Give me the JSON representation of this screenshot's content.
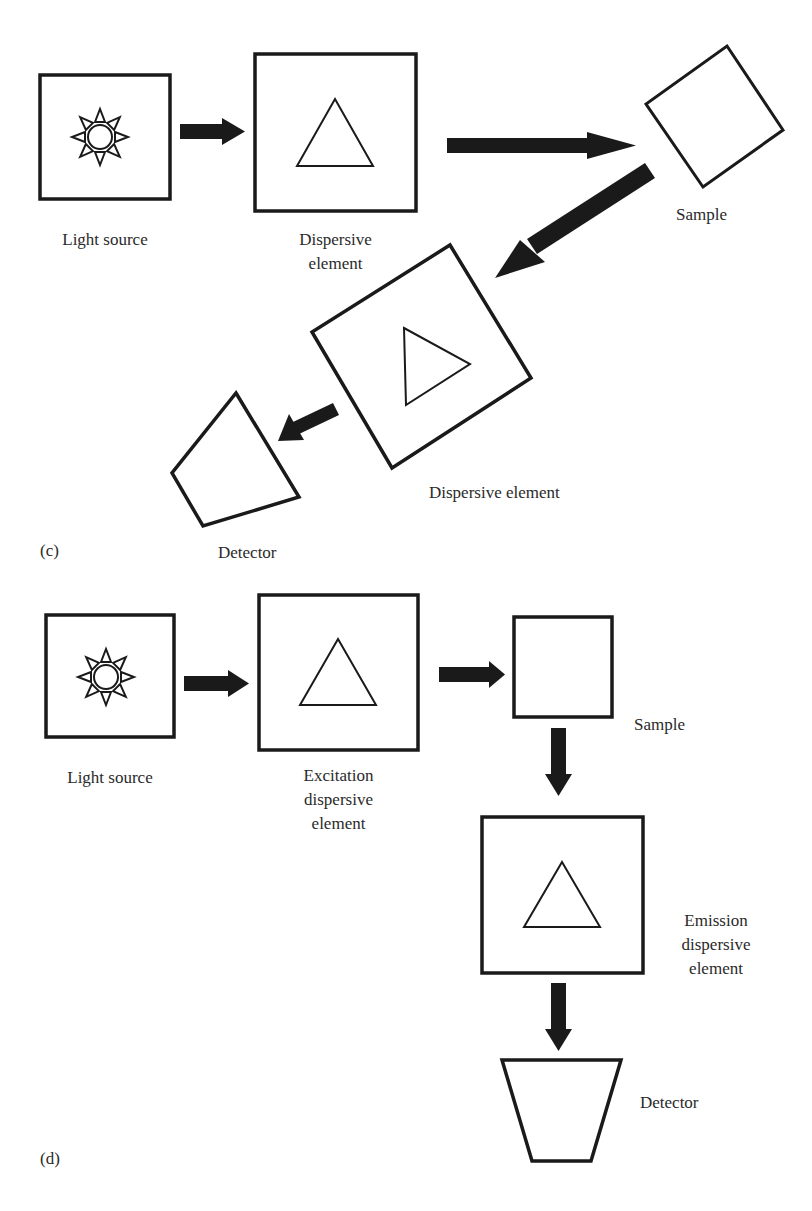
{
  "figure": {
    "colors": {
      "stroke": "#1a1a1a",
      "text": "#2a2a2a",
      "background": "#ffffff"
    },
    "panel_c": {
      "tag": "(c)",
      "light_source": {
        "label": "Light source",
        "icon": "sun-icon"
      },
      "dispersive_element_1": {
        "label": "Dispersive\nelement",
        "icon": "prism-triangle-icon"
      },
      "sample": {
        "label": "Sample"
      },
      "dispersive_element_2": {
        "label": "Dispersive element",
        "icon": "prism-triangle-icon"
      },
      "detector": {
        "label": "Detector"
      }
    },
    "panel_d": {
      "tag": "(d)",
      "light_source": {
        "label": "Light source",
        "icon": "sun-icon"
      },
      "excitation_element": {
        "label": "Excitation\ndispersive\nelement",
        "icon": "prism-triangle-icon"
      },
      "sample": {
        "label": "Sample"
      },
      "emission_element": {
        "label": "Emission\ndispersive\nelement",
        "icon": "prism-triangle-icon"
      },
      "detector": {
        "label": "Detector"
      }
    }
  }
}
